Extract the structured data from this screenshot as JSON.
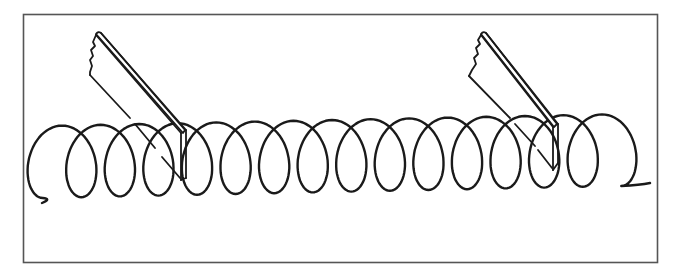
{
  "figure": {
    "frame_color": "#555555",
    "stroke_color": "#1a1a1a",
    "background": "#ffffff",
    "coil": {
      "loop_count": 15,
      "start": [
        42,
        203
      ],
      "end": [
        650,
        183
      ]
    },
    "blades": [
      {
        "name": "left-blade",
        "top": [
          98,
          35
        ],
        "bottom_tip": [
          183,
          182
        ]
      },
      {
        "name": "right-blade",
        "top": [
          483,
          35
        ],
        "bottom_tip": [
          556,
          170
        ]
      }
    ]
  }
}
